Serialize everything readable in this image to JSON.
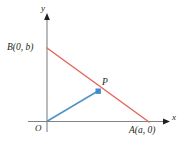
{
  "figure": {
    "type": "coordinate-geometry-diagram",
    "background_color": "#ffffff",
    "axes": {
      "x_axis_label": "x",
      "y_axis_label": "y",
      "origin_label": "O",
      "axis_color": "#808285",
      "arrow_color": "#231f20"
    },
    "points": [
      {
        "id": "B",
        "label": "B(0, b)",
        "x": 47,
        "y": 48,
        "marker": "none"
      },
      {
        "id": "A",
        "label": "A(a, 0)",
        "x": 148,
        "y": 121,
        "marker": "none"
      },
      {
        "id": "P",
        "label": "P",
        "x": 98,
        "y": 91,
        "marker": "square"
      },
      {
        "id": "O",
        "label": "O",
        "x": 47,
        "y": 121,
        "marker": "none"
      }
    ],
    "segments": [
      {
        "id": "line-AB",
        "from": "B",
        "to": "A",
        "color": "#e8665c",
        "width": 1.4
      },
      {
        "id": "line-OP",
        "from": "O",
        "to": "P",
        "color": "#4f93c8",
        "width": 1.4
      }
    ],
    "marker": {
      "fill_color": "#3d8ec9",
      "size": 5
    },
    "colors": {
      "red_line": "#e8665c",
      "blue_line": "#4f93c8",
      "axis_gray": "#808285",
      "text_black": "#231f20"
    }
  }
}
